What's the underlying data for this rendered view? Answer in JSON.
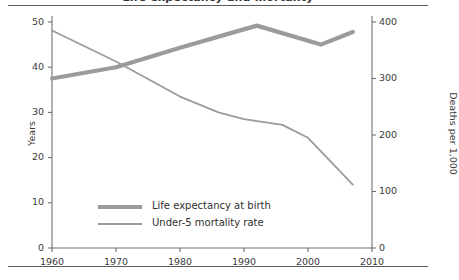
{
  "figure": {
    "title_clipped": "Life expectancy and mortality",
    "has_top_rule": true,
    "has_bottom_rule": true
  },
  "chart_data": {
    "type": "line",
    "title": "",
    "xlabel": "",
    "ylabel": "Years",
    "y2label": "Deaths per 1,000",
    "xlim": [
      1960,
      2010
    ],
    "ylim": [
      0,
      50
    ],
    "y2lim": [
      0,
      400
    ],
    "xticks": [
      1960,
      1970,
      1980,
      1990,
      2000,
      2010
    ],
    "xtick_labels": [
      "1960",
      "1970",
      "1980",
      "1990",
      "2000",
      "2010"
    ],
    "yticks": [
      0,
      10,
      20,
      30,
      40,
      50
    ],
    "ytick_labels": [
      "0",
      "10",
      "20",
      "30",
      "40",
      "50"
    ],
    "y2ticks": [
      0,
      100,
      200,
      300,
      400
    ],
    "y2tick_labels": [
      "0",
      "100",
      "200",
      "300",
      "400"
    ],
    "grid": false,
    "legend_position": "lower-left",
    "series": [
      {
        "name": "Life expectancy at birth",
        "axis": "left",
        "units": "years",
        "color": "#9b9b9b",
        "line_width": 4.2,
        "x": [
          1960,
          1970,
          1980,
          1992,
          2002,
          2007
        ],
        "values": [
          37.5,
          40.0,
          44.3,
          49.2,
          45.0,
          47.8
        ]
      },
      {
        "name": "Under-5 mortality rate",
        "axis": "right",
        "units": "deaths per 1,000",
        "color": "#9b9b9b",
        "line_width": 1.8,
        "x": [
          1960,
          1970,
          1980,
          1986,
          1990,
          1996,
          2000,
          2007
        ],
        "values": [
          385,
          330,
          268,
          240,
          228,
          218,
          195,
          112
        ]
      }
    ]
  },
  "legend": {
    "items": [
      {
        "label": "Life expectancy at birth",
        "swatch": "thick"
      },
      {
        "label": "Under-5 mortality rate",
        "swatch": "thin"
      }
    ]
  }
}
